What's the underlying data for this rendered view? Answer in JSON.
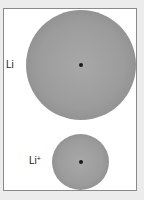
{
  "diagram": {
    "atom": {
      "label": "Li",
      "description": "Lithium atom (larger sphere)",
      "nucleus": "nucleus-dot"
    },
    "ion": {
      "label_base": "Li",
      "label_charge": "+",
      "description": "Lithium ion (smaller sphere)",
      "nucleus": "nucleus-dot"
    },
    "colors": {
      "background": "#ececec",
      "frame_fill": "#ffffff",
      "frame_border": "#8a8a8a",
      "sphere": "#9c9c9c",
      "nucleus": "#1a1a1a"
    }
  }
}
